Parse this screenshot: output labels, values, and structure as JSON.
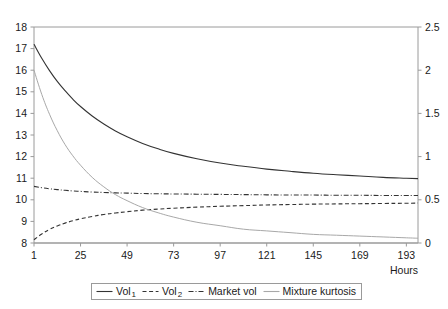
{
  "chart_data": {
    "type": "line",
    "title": "",
    "xlabel": "Hours",
    "ylabel": "",
    "y2label": "",
    "grid": false,
    "legend_position": "bottom",
    "x": [
      1,
      25,
      49,
      73,
      97,
      121,
      145,
      169,
      193
    ],
    "xlim": [
      1,
      199
    ],
    "xticks": [
      "1",
      "25",
      "49",
      "73",
      "97",
      "121",
      "145",
      "169",
      "193"
    ],
    "ylim": [
      8,
      18
    ],
    "yticks": [
      "8",
      "9",
      "10",
      "11",
      "12",
      "13",
      "14",
      "15",
      "16",
      "17",
      "18"
    ],
    "y2lim": [
      0,
      2.5
    ],
    "y2ticks": [
      "0",
      "0.5",
      "1",
      "1.5",
      "2",
      "2.5"
    ],
    "series": [
      {
        "name": "Vol_1",
        "label": "Vol",
        "subscript": "1",
        "axis": "left",
        "style": "solid",
        "color": "#333333",
        "x": [
          1,
          5,
          9,
          13,
          17,
          21,
          25,
          31,
          37,
          43,
          49,
          57,
          65,
          73,
          85,
          97,
          109,
          121,
          133,
          145,
          157,
          169,
          181,
          193,
          199
        ],
        "values": [
          17.2,
          16.55,
          15.98,
          15.48,
          15.05,
          14.66,
          14.32,
          13.88,
          13.51,
          13.19,
          12.92,
          12.61,
          12.36,
          12.15,
          11.9,
          11.7,
          11.55,
          11.42,
          11.32,
          11.23,
          11.16,
          11.1,
          11.04,
          11.0,
          10.98
        ]
      },
      {
        "name": "Vol_2",
        "label": "Vol",
        "subscript": "2",
        "axis": "left",
        "style": "dashed",
        "color": "#333333",
        "x": [
          1,
          5,
          9,
          13,
          17,
          21,
          25,
          31,
          37,
          43,
          49,
          57,
          65,
          73,
          85,
          97,
          109,
          121,
          133,
          145,
          157,
          169,
          181,
          193,
          199
        ],
        "values": [
          8.15,
          8.42,
          8.63,
          8.79,
          8.92,
          9.03,
          9.12,
          9.23,
          9.32,
          9.39,
          9.45,
          9.52,
          9.57,
          9.61,
          9.66,
          9.7,
          9.73,
          9.76,
          9.78,
          9.8,
          9.81,
          9.82,
          9.83,
          9.84,
          9.85
        ]
      },
      {
        "name": "Market vol",
        "label": "Market vol",
        "subscript": "",
        "axis": "left",
        "style": "dashdot",
        "color": "#333333",
        "x": [
          1,
          5,
          9,
          13,
          17,
          21,
          25,
          31,
          37,
          43,
          49,
          57,
          65,
          73,
          85,
          97,
          109,
          121,
          133,
          145,
          157,
          169,
          181,
          193,
          199
        ],
        "values": [
          10.62,
          10.56,
          10.51,
          10.47,
          10.44,
          10.41,
          10.39,
          10.36,
          10.34,
          10.32,
          10.31,
          10.29,
          10.28,
          10.27,
          10.26,
          10.25,
          10.24,
          10.23,
          10.22,
          10.22,
          10.21,
          10.21,
          10.2,
          10.2,
          10.2
        ]
      },
      {
        "name": "Mixture kurtosis",
        "label": "Mixture kurtosis",
        "subscript": "",
        "axis": "right",
        "style": "solid",
        "color": "#a8a8a8",
        "x": [
          1,
          5,
          9,
          13,
          17,
          21,
          25,
          31,
          37,
          43,
          49,
          57,
          65,
          73,
          85,
          97,
          109,
          121,
          133,
          145,
          157,
          169,
          181,
          193,
          199
        ],
        "values": [
          2.0,
          1.72,
          1.49,
          1.3,
          1.14,
          1.01,
          0.9,
          0.76,
          0.65,
          0.56,
          0.49,
          0.41,
          0.35,
          0.3,
          0.24,
          0.2,
          0.16,
          0.14,
          0.12,
          0.1,
          0.09,
          0.08,
          0.07,
          0.06,
          0.055
        ]
      }
    ]
  },
  "legend": {
    "items": [
      {
        "label": "Vol",
        "subscript": "1"
      },
      {
        "label": "Vol",
        "subscript": "2"
      },
      {
        "label": "Market vol",
        "subscript": ""
      },
      {
        "label": "Mixture kurtosis",
        "subscript": ""
      }
    ]
  },
  "axis_titles": {
    "hours": "Hours"
  },
  "colors": {
    "axis": "#9a9a9a",
    "dark_line": "#333333",
    "gray_line": "#a8a8a8",
    "text": "#1a1a1a"
  }
}
